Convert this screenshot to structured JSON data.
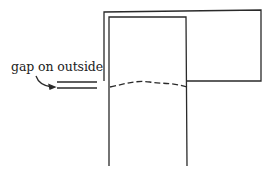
{
  "diagram": {
    "annotation": "gap on outside",
    "stroke_color": "#2a2a2a",
    "elements": [
      {
        "name": "outer-sleeve",
        "shape": "rectangle",
        "x": 104,
        "y": 12,
        "width": 157,
        "height": 69
      },
      {
        "name": "inner-tube",
        "shape": "open-rectangle",
        "left": 109,
        "right": 186,
        "top": 17,
        "bottom": 166
      },
      {
        "name": "dashed-seam",
        "shape": "dashed-wavy-line",
        "y": 84
      },
      {
        "name": "gap-lines",
        "shape": "double-line",
        "x1": 57,
        "x2": 97,
        "y": [
          82,
          88
        ]
      },
      {
        "name": "pointer-arrow",
        "shape": "curved-arrow"
      }
    ]
  }
}
